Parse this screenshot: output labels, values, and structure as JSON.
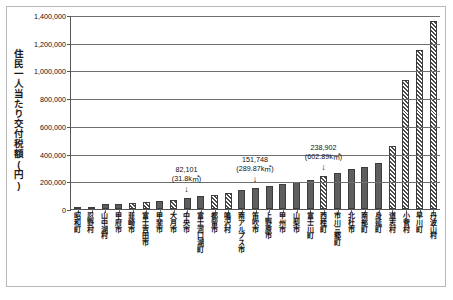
{
  "chart_data": {
    "type": "bar",
    "title": "",
    "xlabel": "",
    "ylabel": "住民一人当たり交付税額(円)",
    "ylim": [
      0,
      1400000
    ],
    "ytick_labels": [
      "0",
      "200,000",
      "400,000",
      "600,000",
      "800,000",
      "1,000,000",
      "1,200,000",
      "1,400,000"
    ],
    "ytick_values": [
      0,
      200000,
      400000,
      600000,
      800000,
      1000000,
      1200000,
      1400000
    ],
    "grid": true,
    "legend": "none",
    "categories": [
      "昭和町",
      "忍野村",
      "山中湖村",
      "甲府市",
      "韮崎市",
      "富士吉田市",
      "甲斐市",
      "大月市",
      "中央市",
      "富士河口湖町",
      "都留市",
      "鳴沢村",
      "南アルプス市",
      "笛吹市",
      "上野原市",
      "甲州市",
      "山梨市",
      "富士川町",
      "西桂町",
      "市川三郷町",
      "北杜市",
      "南部町",
      "身延町",
      "道志村",
      "小菅村",
      "早川町",
      "丹波山村"
    ],
    "values": [
      8000,
      14000,
      34000,
      38000,
      46000,
      52000,
      58000,
      66000,
      82101,
      92000,
      104000,
      118000,
      134000,
      151748,
      168000,
      182000,
      196000,
      212000,
      238902,
      262000,
      286000,
      306000,
      330000,
      452000,
      930000,
      1150000,
      1355000
    ],
    "fills": [
      "solid",
      "hatch",
      "solid",
      "solid",
      "hatch",
      "hatch",
      "solid",
      "hatch",
      "solid",
      "solid",
      "hatch",
      "hatch",
      "solid",
      "solid",
      "solid",
      "solid",
      "solid",
      "solid",
      "hatch",
      "solid",
      "solid",
      "solid",
      "solid",
      "hatch",
      "hatch",
      "hatch",
      "hatch"
    ],
    "annotations": [
      {
        "value_label": "82,101",
        "area_label": "(31.8k㎡)",
        "category": "中央市",
        "arrow": "↓"
      },
      {
        "value_label": "151,748",
        "area_label": "(289.87k㎡)",
        "category": "笛吹市",
        "arrow": "↓"
      },
      {
        "value_label": "238,902",
        "area_label": "(602.89k㎡)",
        "category": "西桂町",
        "arrow": "↓"
      }
    ]
  },
  "colors": {
    "bar_solid": "#5e5e5e",
    "bar_outline": "#3d3d3d",
    "gridline": "#6f6f6f",
    "axis": "#555555",
    "frame": "#b9b9b9",
    "text": "#111111"
  }
}
